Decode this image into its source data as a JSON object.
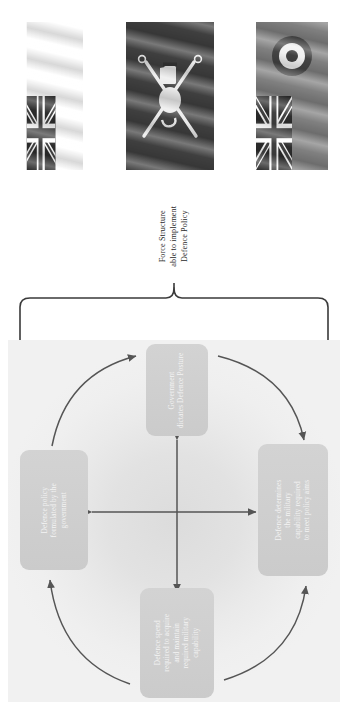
{
  "page": {
    "orientation": "rotated-90-ccw",
    "background_color": "#ffffff"
  },
  "flags": {
    "items": [
      {
        "name": "white-ensign",
        "label": "White Ensign (Royal Navy)"
      },
      {
        "name": "army-flag",
        "label": "British Army Flag"
      },
      {
        "name": "raf-ensign",
        "label": "Royal Air Force Ensign"
      }
    ]
  },
  "caption": {
    "lines": [
      "Force Structure",
      "able to implement",
      "Defence Policy"
    ],
    "line1": "Force Structure",
    "line2": "able to implement",
    "line3": "Defence Policy"
  },
  "diagram": {
    "type": "cycle",
    "background_color": "#e8e8e8",
    "node_fill": "#cfcfcf",
    "node_text_color": "#f4f4f4",
    "arrow_color": "#555555",
    "nodes": [
      {
        "id": "top",
        "name": "government-dictates-defence-posture",
        "lines": [
          "Government",
          "dictates Defence Posture"
        ],
        "line1": "Government",
        "line2": "dictates Defence Posture"
      },
      {
        "id": "right",
        "name": "defence-determines-military-capability",
        "lines": [
          "Defence determines",
          "the military",
          "capability required",
          "to meet policy aims"
        ],
        "line1": "Defence determines",
        "line2": "the military",
        "line3": "capability required",
        "line4": "to meet policy aims"
      },
      {
        "id": "bottom",
        "name": "defence-spend-required",
        "lines": [
          "Defence spend",
          "required to acquire",
          "and maintain",
          "required military",
          "capability"
        ],
        "line1": "Defence spend",
        "line2": "required to acquire",
        "line3": "and maintain",
        "line4": "required military",
        "line5": "capability"
      },
      {
        "id": "left",
        "name": "defence-policy-formulated-by-government",
        "lines": [
          "Defence policy",
          "formulated by the",
          "government"
        ],
        "line1": "Defence policy",
        "line2": "formulated by the",
        "line3": "government"
      }
    ],
    "edges": [
      {
        "from": "left",
        "to": "top",
        "style": "curved-arrow"
      },
      {
        "from": "top",
        "to": "right",
        "style": "curved-arrow"
      },
      {
        "from": "bottom",
        "to": "right",
        "style": "curved-arrow"
      },
      {
        "from": "bottom",
        "to": "left",
        "style": "curved-arrow"
      },
      {
        "from": "top",
        "to": "bottom",
        "style": "double-headed-straight"
      },
      {
        "from": "left",
        "to": "right",
        "style": "double-headed-straight"
      }
    ]
  },
  "brace": {
    "name": "curly-brace",
    "direction": "points-to-caption"
  }
}
